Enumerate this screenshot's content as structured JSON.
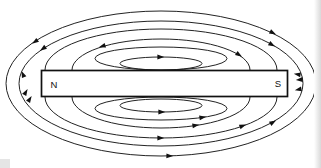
{
  "diagram": {
    "background": "#ffffff",
    "line_color": "#232323",
    "arrow_color": "#111111",
    "magnet": {
      "x": 41.5,
      "y": 70.5,
      "width": 246,
      "height": 26,
      "fill": "#ffffff",
      "stroke": "#111111",
      "stroke_width": 1.7,
      "labels": {
        "north": "N",
        "south": "S"
      },
      "label_positions": {
        "north": {
          "x": 54,
          "y": 87.5
        },
        "south": {
          "x": 278,
          "y": 87
        }
      }
    },
    "field_lines": {
      "ellipses": [
        {
          "cx": 161,
          "cy": 63.5,
          "rx": 41,
          "ry": 6.5
        },
        {
          "cx": 161,
          "cy": 58.5,
          "rx": 66,
          "ry": 11.5
        },
        {
          "cx": 161,
          "cy": 105.5,
          "rx": 41,
          "ry": 6.5
        },
        {
          "cx": 161,
          "cy": 108.5,
          "rx": 66,
          "ry": 11.5
        },
        {
          "cx": 161,
          "cy": 83.5,
          "rx": 142,
          "ry": 62.5
        },
        {
          "cx": 161,
          "cy": 83.5,
          "rx": 155,
          "ry": 72.5
        }
      ],
      "arcs": [
        {
          "d": "M72,70 A89,31 0 1 1 250,70"
        },
        {
          "d": "M72,97 A89,31 0 1 0 250,97"
        },
        {
          "d": "M45,70 A116,41 0 1 1 277,70"
        },
        {
          "d": "M45,97 A116,41 0 1 0 277,97"
        }
      ]
    },
    "arrows": [
      {
        "x": 163,
        "y": 57,
        "deg": 0
      },
      {
        "x": 100,
        "y": 47,
        "deg": 162
      },
      {
        "x": 33,
        "y": 43,
        "deg": 146
      },
      {
        "x": 41,
        "y": 50,
        "deg": 145
      },
      {
        "x": 22,
        "y": 72,
        "deg": 247
      },
      {
        "x": 275,
        "y": 34,
        "deg": 27
      },
      {
        "x": 274,
        "y": 46,
        "deg": 30
      },
      {
        "x": 241,
        "y": 56,
        "deg": 33
      },
      {
        "x": 295,
        "y": 74,
        "deg": 190
      },
      {
        "x": 297,
        "y": 80,
        "deg": 175
      },
      {
        "x": 296,
        "y": 90,
        "deg": 168
      },
      {
        "x": 27,
        "y": 90,
        "deg": 300
      },
      {
        "x": 31,
        "y": 97,
        "deg": 302
      },
      {
        "x": 164,
        "y": 112,
        "deg": 0
      },
      {
        "x": 205,
        "y": 117,
        "deg": 351
      },
      {
        "x": 198,
        "y": 125,
        "deg": 351
      },
      {
        "x": 163,
        "y": 138,
        "deg": 0
      },
      {
        "x": 245,
        "y": 125,
        "deg": 340
      },
      {
        "x": 275,
        "y": 121,
        "deg": 329
      },
      {
        "x": 172,
        "y": 156,
        "deg": 2
      }
    ]
  }
}
